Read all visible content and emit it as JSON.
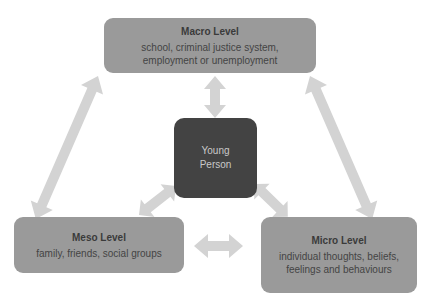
{
  "diagram": {
    "type": "ecological levels diagram",
    "colors": {
      "outer_box": "#9a9a9a",
      "center_box": "#434343",
      "arrow": "#d3d3d3",
      "background": "#ffffff"
    },
    "center": {
      "label_line1": "Young",
      "label_line2": "Person"
    },
    "macro": {
      "title": "Macro Level",
      "desc_line1": "school, criminal justice system,",
      "desc_line2": "employment or unemployment"
    },
    "meso": {
      "title": "Meso Level",
      "desc_line1": "family, friends, social groups"
    },
    "micro": {
      "title": "Micro Level",
      "desc_line1": "individual thoughts, beliefs,",
      "desc_line2": "feelings and behaviours"
    },
    "connections": [
      {
        "from": "macro",
        "to": "young-person",
        "type": "bidirectional"
      },
      {
        "from": "meso",
        "to": "young-person",
        "type": "bidirectional"
      },
      {
        "from": "micro",
        "to": "young-person",
        "type": "bidirectional"
      },
      {
        "from": "macro",
        "to": "meso",
        "type": "bidirectional"
      },
      {
        "from": "macro",
        "to": "micro",
        "type": "bidirectional"
      },
      {
        "from": "meso",
        "to": "micro",
        "type": "bidirectional"
      }
    ]
  }
}
